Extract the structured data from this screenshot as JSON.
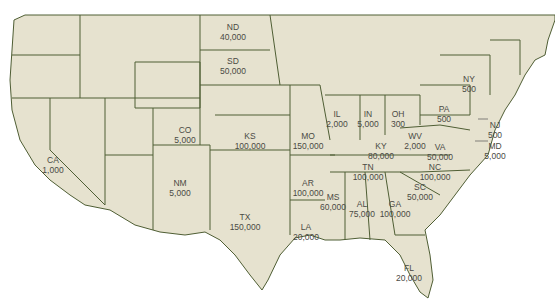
{
  "colors": {
    "land": "#e6e2cf",
    "border": "#4f5e34",
    "text": "#4a4a44",
    "water": "#ffffff"
  },
  "states": [
    {
      "abbr": "ND",
      "value": "40,000",
      "x": 233,
      "y": 22
    },
    {
      "abbr": "SD",
      "value": "50,000",
      "x": 233,
      "y": 56
    },
    {
      "abbr": "CO",
      "value": "5,000",
      "x": 185,
      "y": 125
    },
    {
      "abbr": "KS",
      "value": "100,000",
      "x": 250,
      "y": 131
    },
    {
      "abbr": "MO",
      "value": "150,000",
      "x": 308,
      "y": 131
    },
    {
      "abbr": "NM",
      "value": "5,000",
      "x": 180,
      "y": 178
    },
    {
      "abbr": "AR",
      "value": "100,000",
      "x": 308,
      "y": 178
    },
    {
      "abbr": "TX",
      "value": "150,000",
      "x": 245,
      "y": 212
    },
    {
      "abbr": "CA",
      "value": "1,000",
      "x": 53,
      "y": 155
    },
    {
      "abbr": "IL",
      "value": "2,000",
      "x": 337,
      "y": 109
    },
    {
      "abbr": "IN",
      "value": "5,000",
      "x": 368,
      "y": 109
    },
    {
      "abbr": "OH",
      "value": "300",
      "x": 398,
      "y": 109
    },
    {
      "abbr": "PA",
      "value": "500",
      "x": 444,
      "y": 104
    },
    {
      "abbr": "NY",
      "value": "500",
      "x": 469,
      "y": 74
    },
    {
      "abbr": "KY",
      "value": "80,000",
      "x": 381,
      "y": 141
    },
    {
      "abbr": "WV",
      "value": "2,000",
      "x": 415,
      "y": 131
    },
    {
      "abbr": "VA",
      "value": "50,000",
      "x": 440,
      "y": 142
    },
    {
      "abbr": "NJ",
      "value": "500",
      "x": 495,
      "y": 120
    },
    {
      "abbr": "MD",
      "value": "5,000",
      "x": 495,
      "y": 141
    },
    {
      "abbr": "TN",
      "value": "100,000",
      "x": 368,
      "y": 162
    },
    {
      "abbr": "NC",
      "value": "100,000",
      "x": 435,
      "y": 162
    },
    {
      "abbr": "SC",
      "value": "50,000",
      "x": 420,
      "y": 182
    },
    {
      "abbr": "MS",
      "value": "60,000",
      "x": 333,
      "y": 192
    },
    {
      "abbr": "AL",
      "value": "75,000",
      "x": 362,
      "y": 199
    },
    {
      "abbr": "GA",
      "value": "100,000",
      "x": 395,
      "y": 199
    },
    {
      "abbr": "LA",
      "value": "20,000",
      "x": 306,
      "y": 222
    },
    {
      "abbr": "FL",
      "value": "20,000",
      "x": 409,
      "y": 263
    }
  ]
}
